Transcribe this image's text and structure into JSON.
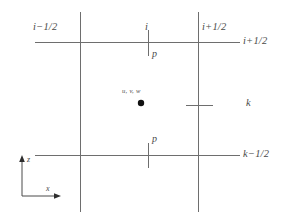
{
  "figure": {
    "background_color": "#ffffff",
    "line_color": "#6e6e6e",
    "text_color": "#4a4a4a",
    "marker_color": "#111111"
  },
  "grid": {
    "vertical_lines": [
      {
        "name": "left-vertical-gridline",
        "x": 80,
        "y1": 12,
        "y2": 212
      },
      {
        "name": "right-vertical-gridline",
        "x": 198,
        "y1": 12,
        "y2": 212
      }
    ],
    "horizontal_lines": [
      {
        "name": "top-horizontal-gridline",
        "y": 42,
        "x1": 35,
        "x2": 240
      },
      {
        "name": "bottom-horizontal-gridline",
        "y": 155,
        "x1": 35,
        "x2": 240
      }
    ],
    "ticks": [
      {
        "name": "top-pressure-tick",
        "orientation": "vertical",
        "x": 148,
        "y1": 30,
        "y2": 56
      },
      {
        "name": "bottom-pressure-tick",
        "orientation": "vertical",
        "x": 148,
        "y1": 143,
        "y2": 168
      },
      {
        "name": "right-k-tick",
        "orientation": "horizontal",
        "y": 105,
        "x1": 186,
        "x2": 213
      }
    ]
  },
  "labels": {
    "top_left_face": "i−1/2",
    "top_center": "i",
    "top_right_face": "i+1/2",
    "right_top_row": "i+1/2",
    "right_center_row": "k",
    "right_bottom_row": "k−1/2",
    "pressure_top": "p",
    "pressure_bottom": "p",
    "cell_center_velocities": "u, v, w"
  },
  "axes": {
    "vertical_label": "z",
    "horizontal_label": "x",
    "origin": {
      "x": 22,
      "y": 196
    },
    "vertical_tip": {
      "x": 22,
      "y": 158
    },
    "horizontal_tip": {
      "x": 58,
      "y": 196
    }
  },
  "cell_center_marker": {
    "name": "cell-center-point",
    "x": 141,
    "y": 103,
    "radius": 3.2
  }
}
